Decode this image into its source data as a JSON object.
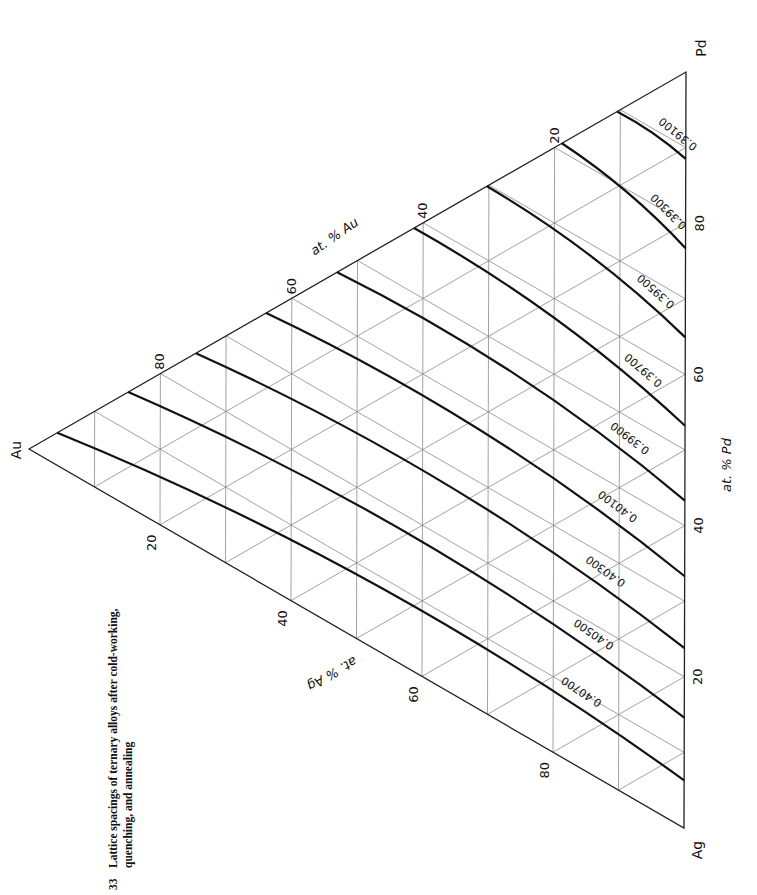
{
  "caption": {
    "number": "33",
    "line1": "Lattice spacings of ternary alloys after cold-working,",
    "line2": "quenching, and annealing"
  },
  "chart_data": {
    "type": "ternary-contour",
    "title": "Lattice spacings of ternary alloys after cold-working, quenching, and annealing",
    "components": [
      "Au",
      "Pd",
      "Ag"
    ],
    "vertices": {
      "Au": {
        "label": "Au",
        "x": 29,
        "y": 449
      },
      "Pd": {
        "label": "Pd",
        "x": 686,
        "y": 72
      },
      "Ag": {
        "label": "Ag",
        "x": 684,
        "y": 828
      }
    },
    "axes": [
      {
        "name": "at. % Au",
        "ticks": [
          "20",
          "40",
          "60",
          "80"
        ]
      },
      {
        "name": "at. % Pd",
        "ticks": [
          "20",
          "40",
          "60",
          "80"
        ]
      },
      {
        "name": "at. % Ag",
        "ticks": [
          "20",
          "40",
          "60",
          "80"
        ]
      }
    ],
    "grid": true,
    "grid_step": 10,
    "contour_unit": "nm",
    "contours": [
      {
        "label": "0.39100",
        "value": 0.391,
        "start_pd_on_AuPd_edge": 0.895,
        "end_pd_on_PdAg_edge": 0.885
      },
      {
        "label": "0.39300",
        "value": 0.393,
        "start_pd_on_AuPd_edge": 0.811,
        "end_pd_on_PdAg_edge": 0.767
      },
      {
        "label": "0.39500",
        "value": 0.395,
        "start_pd_on_AuPd_edge": 0.697,
        "end_pd_on_PdAg_edge": 0.649
      },
      {
        "label": "0.39700",
        "value": 0.397,
        "start_pd_on_AuPd_edge": 0.586,
        "end_pd_on_PdAg_edge": 0.532
      },
      {
        "label": "0.39900",
        "value": 0.399,
        "start_pd_on_AuPd_edge": 0.469,
        "end_pd_on_PdAg_edge": 0.433
      },
      {
        "label": "0.40100",
        "value": 0.401,
        "start_pd_on_AuPd_edge": 0.361,
        "end_pd_on_PdAg_edge": 0.333
      },
      {
        "label": "0.40300",
        "value": 0.403,
        "start_pd_on_AuPd_edge": 0.254,
        "end_pd_on_PdAg_edge": 0.238
      },
      {
        "label": "0.40500",
        "value": 0.405,
        "start_pd_on_AuPd_edge": 0.151,
        "end_pd_on_PdAg_edge": 0.146
      },
      {
        "label": "0.40700",
        "value": 0.407,
        "start_pd_on_AuPd_edge": 0.043,
        "end_pd_on_PdAg_edge": 0.063
      }
    ]
  },
  "style": {
    "frame_color": "#222222",
    "grid_color": "#8a8a8a",
    "contour_color": "#111111",
    "background": "#ffffff"
  }
}
